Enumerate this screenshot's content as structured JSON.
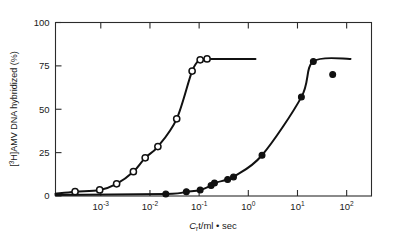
{
  "figure": {
    "name": "hybridization-kinetics-plot",
    "background_color": "#ffffff",
    "ink_color": "#111111"
  },
  "chart_data": {
    "type": "scatter",
    "title": "",
    "subtitle": "",
    "xlabel": "C_r t/ml • sec",
    "xlabel_parts": {
      "c": "C",
      "sub_r": "r",
      "rest": "t/ml • sec"
    },
    "ylabel": "[³H]AMV DNA hybridized (%)",
    "ylabel_parts": {
      "open_bracket": "[",
      "sup": "3",
      "h": "H]AMV DNA hybridized (%)"
    },
    "xscale": "log",
    "yscale": "linear",
    "xlim": [
      0.00012,
      320
    ],
    "ylim": [
      0,
      100
    ],
    "grid": false,
    "legend": "none",
    "xticks": [
      0.001,
      0.01,
      0.1,
      1,
      10,
      100
    ],
    "xticklabels": [
      "10⁻³",
      "10⁻²",
      "10⁻¹",
      "10⁰",
      "10¹",
      "10²"
    ],
    "xtick_mantissa": "10",
    "xtick_exponents": [
      "-3",
      "-2",
      "-1",
      "0",
      "1",
      "2"
    ],
    "yticks": [
      0,
      25,
      50,
      75,
      100
    ],
    "yticklabels": [
      "0",
      "25",
      "50",
      "75",
      "100"
    ],
    "series": [
      {
        "name": "open-circles",
        "marker": "open circle",
        "marker_fill": "#ffffff",
        "marker_edge": "#111111",
        "points": [
          {
            "x": 0.0003,
            "y": 2.5
          },
          {
            "x": 0.00095,
            "y": 3.5
          },
          {
            "x": 0.0021,
            "y": 7.0
          },
          {
            "x": 0.0046,
            "y": 14.0
          },
          {
            "x": 0.008,
            "y": 22.0
          },
          {
            "x": 0.0145,
            "y": 28.5
          },
          {
            "x": 0.035,
            "y": 44.5
          },
          {
            "x": 0.072,
            "y": 72.0
          },
          {
            "x": 0.105,
            "y": 78.5
          },
          {
            "x": 0.145,
            "y": 79.0
          }
        ],
        "plateau_y": 79.0,
        "plateau_x_end": 1.4
      },
      {
        "name": "filled-circles",
        "marker": "filled circle",
        "marker_fill": "#111111",
        "marker_edge": "#111111",
        "points": [
          {
            "x": 0.021,
            "y": 1.2
          },
          {
            "x": 0.055,
            "y": 2.5
          },
          {
            "x": 0.105,
            "y": 3.5
          },
          {
            "x": 0.175,
            "y": 6.0
          },
          {
            "x": 0.205,
            "y": 7.5
          },
          {
            "x": 0.38,
            "y": 9.5
          },
          {
            "x": 0.5,
            "y": 11.0
          },
          {
            "x": 1.9,
            "y": 23.5
          },
          {
            "x": 12.0,
            "y": 57.0
          },
          {
            "x": 21.0,
            "y": 77.5
          },
          {
            "x": 52.0,
            "y": 70.0
          }
        ],
        "plateau_y": 79.0,
        "plateau_x_end": 120.0,
        "outlier": {
          "x": 52.0,
          "y": 70.0
        }
      }
    ]
  }
}
